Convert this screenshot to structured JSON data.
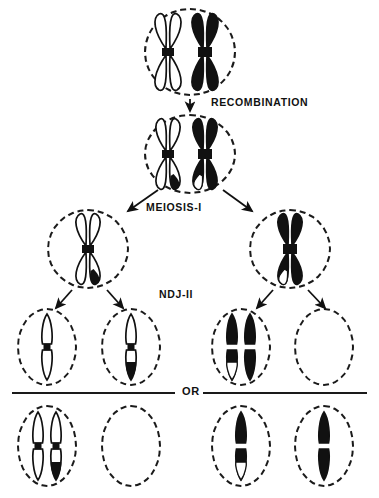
{
  "figure": {
    "width": 379,
    "height": 498,
    "background_color": "#ffffff",
    "ink_color": "#111111"
  },
  "labels": {
    "recombination": "RECOMBINATION",
    "meiosis_1": "MEIOSIS-I",
    "ndj_2": "NDJ-II",
    "or": "OR"
  },
  "legend": {
    "white_chromosome": "outline (unshaded) homolog",
    "black_chromosome": "solid (shaded) homolog",
    "centromere": "black band at chromosome waist"
  },
  "stages": [
    {
      "id": "parent-cell",
      "name": "parent cell before recombination",
      "cell_shape": "circle",
      "chromosomes": [
        {
          "name": "white-x-chromosome",
          "fill": "white",
          "shape": "x",
          "tip_marks": []
        },
        {
          "name": "black-x-chromosome",
          "fill": "black",
          "shape": "x",
          "tip_marks": []
        }
      ]
    },
    {
      "id": "recombined-cell",
      "name": "cell after recombination",
      "cell_shape": "circle",
      "chromosomes": [
        {
          "name": "white-x-chromosome-recombinant",
          "fill": "white",
          "shape": "x",
          "tip_marks": [
            "black lower-right arm tip"
          ]
        },
        {
          "name": "black-x-chromosome-recombinant",
          "fill": "black",
          "shape": "x",
          "tip_marks": [
            "white lower-left arm tip"
          ]
        }
      ]
    },
    {
      "id": "meiosis1-left-cell",
      "name": "meiosis I product, left",
      "cell_shape": "circle",
      "chromosomes": [
        {
          "name": "white-x-chromosome-recombinant",
          "fill": "white",
          "shape": "x",
          "tip_marks": [
            "black lower-right arm tip"
          ]
        }
      ]
    },
    {
      "id": "meiosis1-right-cell",
      "name": "meiosis I product, right",
      "cell_shape": "circle",
      "chromosomes": [
        {
          "name": "black-x-chromosome-recombinant",
          "fill": "black",
          "shape": "x",
          "tip_marks": [
            "white lower-left arm tip"
          ]
        }
      ]
    }
  ],
  "gamete_rows": [
    {
      "id": "gamete-row-1",
      "name": "first alternative set of gametes",
      "gametes": [
        {
          "id": "gamete-1-1",
          "name": "white chromatid gamete",
          "chromatid_count": 1,
          "chromatids": [
            {
              "fill": "white",
              "tip_marks": []
            }
          ]
        },
        {
          "id": "gamete-1-2",
          "name": "recombinant white chromatid gamete",
          "chromatid_count": 1,
          "chromatids": [
            {
              "fill": "white",
              "tip_marks": [
                "black bottom tip"
              ]
            }
          ]
        },
        {
          "id": "gamete-1-3",
          "name": "disomic black chromatid gamete",
          "chromatid_count": 2,
          "chromatids": [
            {
              "fill": "black",
              "tip_marks": [
                "white bottom tip"
              ]
            },
            {
              "fill": "black",
              "tip_marks": []
            }
          ]
        },
        {
          "id": "gamete-1-4",
          "name": "nullisomic empty gamete",
          "chromatid_count": 0,
          "chromatids": []
        }
      ]
    },
    {
      "id": "gamete-row-2",
      "name": "second alternative set of gametes",
      "gametes": [
        {
          "id": "gamete-2-1",
          "name": "disomic white chromatid gamete",
          "chromatid_count": 2,
          "chromatids": [
            {
              "fill": "white",
              "tip_marks": []
            },
            {
              "fill": "white",
              "tip_marks": [
                "black bottom tip"
              ]
            }
          ]
        },
        {
          "id": "gamete-2-2",
          "name": "nullisomic empty gamete",
          "chromatid_count": 0,
          "chromatids": []
        },
        {
          "id": "gamete-2-3",
          "name": "recombinant black chromatid gamete",
          "chromatid_count": 1,
          "chromatids": [
            {
              "fill": "black",
              "tip_marks": [
                "white bottom tip"
              ]
            }
          ]
        },
        {
          "id": "gamete-2-4",
          "name": "black chromatid gamete",
          "chromatid_count": 1,
          "chromatids": [
            {
              "fill": "black",
              "tip_marks": []
            }
          ]
        }
      ]
    }
  ],
  "arrows": [
    {
      "name": "arrow-parent-to-recombined",
      "from": "parent-cell",
      "to": "recombined-cell"
    },
    {
      "name": "arrow-meiosis1-left",
      "from": "recombined-cell",
      "to": "meiosis1-left-cell"
    },
    {
      "name": "arrow-meiosis1-right",
      "from": "recombined-cell",
      "to": "meiosis1-right-cell"
    },
    {
      "name": "arrow-ndj2-left-a",
      "from": "meiosis1-left-cell",
      "to": "gamete-1-1"
    },
    {
      "name": "arrow-ndj2-left-b",
      "from": "meiosis1-left-cell",
      "to": "gamete-1-2"
    },
    {
      "name": "arrow-ndj2-right-a",
      "from": "meiosis1-right-cell",
      "to": "gamete-1-3"
    },
    {
      "name": "arrow-ndj2-right-b",
      "from": "meiosis1-right-cell",
      "to": "gamete-1-4"
    }
  ]
}
